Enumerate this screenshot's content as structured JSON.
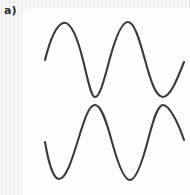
{
  "figure": {
    "panel_label": "a)",
    "background_color": "#f2f2f2",
    "card_color": "#fdfdfd"
  },
  "chart_data": {
    "type": "line",
    "title": "",
    "subtitle": "",
    "xlabel": "",
    "ylabel": "",
    "xlim": [
      45,
      184
    ],
    "ylim": [
      195,
      0
    ],
    "grid": false,
    "legend": null,
    "axes_visible": false,
    "tick_labels": [],
    "annotations": [
      {
        "text": "a)",
        "x": 5,
        "y": 11
      }
    ],
    "stroke_color": "#3a3a3a",
    "stroke_width": 2.1,
    "series": [
      {
        "name": "upper-sine",
        "description": "sine wave, cosine-like phase, starts rising at left",
        "center_y": 60,
        "amplitude": 37,
        "period": 65,
        "x_start": 45,
        "x_end": 184,
        "phase": "rising",
        "extrema": [
          {
            "kind": "start",
            "x": 45,
            "y": 60
          },
          {
            "kind": "peak",
            "x": 63,
            "y": 23
          },
          {
            "kind": "trough",
            "x": 95,
            "y": 97
          },
          {
            "kind": "peak",
            "x": 128,
            "y": 22
          },
          {
            "kind": "trough",
            "x": 163,
            "y": 97
          },
          {
            "kind": "end",
            "x": 184,
            "y": 62
          }
        ],
        "path": "M 45 60 C 49 44 55 26 63 23 C 71 20 78 40 83 60 C 88 80 91 97 95 97 C 100 97 104 80 110 58 C 116 36 122 22 128 22 C 134 22 139 38 145 60 C 151 82 156 97 163 97 C 170 97 177 80 184 62"
      },
      {
        "name": "lower-sine",
        "description": "sine wave inverted in phase relative to upper, starts falling at left",
        "center_y": 142,
        "amplitude": 37,
        "period": 72,
        "x_start": 45,
        "x_end": 184,
        "phase": "falling",
        "extrema": [
          {
            "kind": "start",
            "x": 45,
            "y": 142
          },
          {
            "kind": "trough",
            "x": 59,
            "y": 179
          },
          {
            "kind": "peak",
            "x": 95,
            "y": 105
          },
          {
            "kind": "trough",
            "x": 130,
            "y": 180
          },
          {
            "kind": "peak",
            "x": 163,
            "y": 105
          },
          {
            "kind": "end",
            "x": 184,
            "y": 140
          }
        ],
        "path": "M 45 142 C 48 160 53 179 59 179 C 66 179 72 160 79 137 C 86 114 90 105 95 105 C 101 105 106 120 112 142 C 118 164 124 180 130 180 C 136 180 142 163 148 140 C 154 117 158 105 163 105 C 169 105 178 122 184 140"
      }
    ]
  }
}
